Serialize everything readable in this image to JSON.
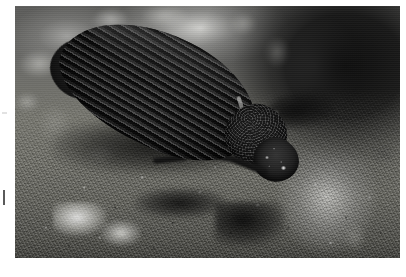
{
  "page": {
    "background_color": "#ffffff",
    "width": 406,
    "height": 277
  },
  "photo": {
    "subject": "beetle",
    "subject_description": "dark ribbed beetle on rocky ground",
    "scene": "macro close-up photograph",
    "frame": {
      "left": 15,
      "top": 6,
      "width": 385,
      "height": 252
    },
    "orientation": "landscape",
    "focus": "beetle body in focus, background blurred",
    "palette": {
      "beetle_body": "#1a1a1a",
      "beetle_highlight": "#6c6c6c",
      "rock_midtone": "#77776f",
      "rock_highlight": "#f0f0ec",
      "rock_shadow": "#0a0a0a",
      "background_dark": "#0c0c0c"
    },
    "parts": {
      "elytra": "elytra-wing-cases",
      "elytra_texture": "longitudinal-striae-ridges",
      "pronotum": "pronotum-thorax-shield",
      "pronotum_texture": "granular-pitting",
      "head": "head-capsule",
      "antennae": "antennae-pair",
      "legs": "legs",
      "substrate": "rock-soil-surface"
    }
  },
  "margin_marks": {
    "upper": "faint-grey-tick",
    "lower": "dark-vertical-tick"
  }
}
